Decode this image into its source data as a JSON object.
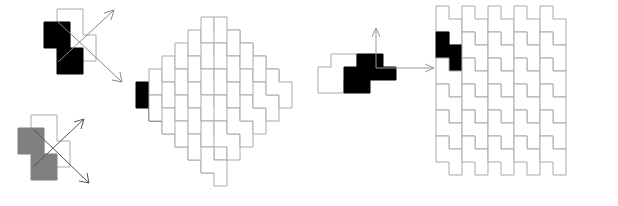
{
  "figure_title": "",
  "colors": {
    "background": "#ffffff",
    "tile_fill_empty": "#ffffff",
    "tile_stroke": "#aaaaaa",
    "tile_stroke_dark": "#888888",
    "highlight_black": "#000000",
    "highlight_gray": "#808080",
    "arrow_color": "#999999",
    "arrow_color_dark": "#666666"
  },
  "geometry": {
    "cell_px": 13,
    "stroke_width": 1,
    "tile_name": "S-tetromino",
    "tile_cells_vertical": [
      [
        0,
        0
      ],
      [
        0,
        1
      ],
      [
        1,
        1
      ],
      [
        1,
        2
      ]
    ],
    "tile_cells_horizontal": [
      [
        0,
        1
      ],
      [
        1,
        1
      ],
      [
        1,
        0
      ],
      [
        2,
        0
      ]
    ]
  },
  "figures": [
    {
      "id": "reflection-black",
      "label": "reflection-pair-black",
      "description": "One black S-tetromino and one outlined S-tetromino overlapping, with two diagonal arrows crossing",
      "tile_fill": "#000000",
      "outline_fill": "#ffffff",
      "cell": 13,
      "tiles": [
        {
          "name": "black-tile",
          "fill": "#000000",
          "stroke": "#000000",
          "origin": [
            1,
            1
          ],
          "orientation": "vertical-s"
        },
        {
          "name": "outline-tile",
          "fill": "none",
          "stroke": "#aaaaaa",
          "origin": [
            3,
            0
          ],
          "orientation": "vertical-z"
        }
      ],
      "arrows": [
        {
          "name": "arrow-up-right",
          "x1": 12,
          "y1": 62,
          "x2": 68,
          "y2": 8
        },
        {
          "name": "arrow-down-right",
          "x1": 12,
          "y1": 22,
          "x2": 78,
          "y2": 80
        }
      ]
    },
    {
      "id": "reflection-gray",
      "label": "reflection-pair-gray",
      "description": "Same reflection pair rendered with a gray tile instead of black",
      "tile_fill": "#808080",
      "outline_fill": "#ffffff",
      "cell": 13,
      "tiles": [
        {
          "name": "gray-tile",
          "fill": "#808080",
          "stroke": "#808080",
          "origin": [
            0,
            1
          ],
          "orientation": "vertical-s"
        },
        {
          "name": "outline-tile",
          "fill": "none",
          "stroke": "#aaaaaa",
          "origin": [
            2,
            0
          ],
          "orientation": "vertical-z"
        }
      ],
      "arrows": [
        {
          "name": "arrow-up-right",
          "x1": 8,
          "y1": 58,
          "x2": 64,
          "y2": 6
        },
        {
          "name": "arrow-down-right",
          "x1": 8,
          "y1": 18,
          "x2": 72,
          "y2": 74
        }
      ]
    },
    {
      "id": "diamond",
      "label": "diamond-tiling",
      "description": "Diamond-shaped region tiled by vertical S-tetrominoes, one highlighted black at the left vertex",
      "cell": 13,
      "highlight_index": 14,
      "highlight_fill": "#000000",
      "tile_count": 36
    },
    {
      "id": "translation",
      "label": "translation-pair",
      "description": "One black horizontal S-tetromino and one outlined horizontal S-tetromino with an up arrow and a right arrow",
      "cell": 13,
      "tiles": [
        {
          "name": "outline-tile",
          "fill": "none",
          "stroke": "#aaaaaa",
          "origin": [
            0,
            0
          ],
          "orientation": "horizontal-s"
        },
        {
          "name": "black-tile",
          "fill": "#000000",
          "stroke": "#000000",
          "origin": [
            2,
            0
          ],
          "orientation": "horizontal-s"
        }
      ],
      "arrows": [
        {
          "name": "arrow-up",
          "x1": 52,
          "y1": 36,
          "x2": 52,
          "y2": 4
        },
        {
          "name": "arrow-right",
          "x1": 52,
          "y1": 36,
          "x2": 114,
          "y2": 36
        }
      ]
    },
    {
      "id": "rectangle",
      "label": "rectangle-tiling",
      "description": "Rectangular region tiled by S-tetrominoes, one highlighted black near the upper left",
      "cell": 13,
      "columns": 5,
      "rows": 6,
      "highlight_fill": "#000000",
      "tile_count": 30
    }
  ]
}
